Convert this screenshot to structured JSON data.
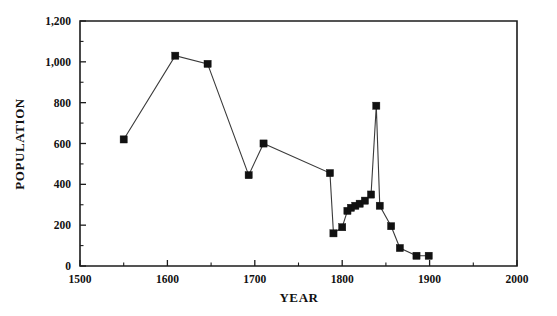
{
  "chart_data": {
    "type": "line",
    "title": "",
    "xlabel": "YEAR",
    "ylabel": "POPULATION",
    "xlim": [
      1500,
      2000
    ],
    "ylim": [
      0,
      1200
    ],
    "grid": false,
    "legend": null,
    "x_ticks": [
      1500,
      1600,
      1700,
      1800,
      1900,
      2000
    ],
    "x_tick_labels": [
      "1500",
      "1600",
      "1700",
      "1800",
      "1900",
      "2000"
    ],
    "x_minor_ticks": [
      1550,
      1650,
      1750,
      1850,
      1950
    ],
    "y_ticks": [
      0,
      200,
      400,
      600,
      800,
      1000,
      1200
    ],
    "y_tick_labels": [
      "0",
      "200",
      "400",
      "600",
      "800",
      "1,000",
      "1,200"
    ],
    "y_minor_ticks": [
      100,
      300,
      500,
      700,
      900,
      1100
    ],
    "marker": "square",
    "marker_color": "#111111",
    "line_color": "#3a3a3a",
    "series": [
      {
        "name": "population",
        "points": [
          {
            "x": 1550,
            "y": 620
          },
          {
            "x": 1609,
            "y": 1030
          },
          {
            "x": 1646,
            "y": 990
          },
          {
            "x": 1693,
            "y": 445
          },
          {
            "x": 1710,
            "y": 600
          },
          {
            "x": 1786,
            "y": 455
          },
          {
            "x": 1790,
            "y": 160
          },
          {
            "x": 1800,
            "y": 190
          },
          {
            "x": 1806,
            "y": 270
          },
          {
            "x": 1810,
            "y": 285
          },
          {
            "x": 1815,
            "y": 295
          },
          {
            "x": 1820,
            "y": 305
          },
          {
            "x": 1826,
            "y": 320
          },
          {
            "x": 1833,
            "y": 350
          },
          {
            "x": 1839,
            "y": 785
          },
          {
            "x": 1843,
            "y": 295
          },
          {
            "x": 1856,
            "y": 195
          },
          {
            "x": 1866,
            "y": 88
          },
          {
            "x": 1885,
            "y": 50
          },
          {
            "x": 1899,
            "y": 50
          }
        ]
      }
    ]
  }
}
